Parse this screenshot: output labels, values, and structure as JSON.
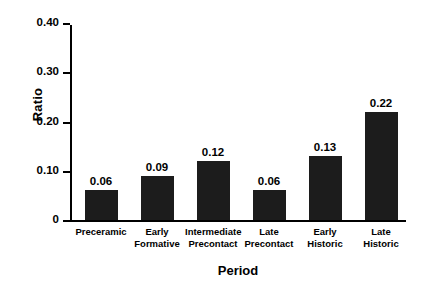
{
  "chart_data": {
    "type": "bar",
    "title": "",
    "xlabel": "Period",
    "ylabel": "Ratio",
    "categories": [
      "Preceramic",
      "Early Formative",
      "Intermediate Precontact",
      "Late Precontact",
      "Early Historic",
      "Late Historic"
    ],
    "category_lines": [
      [
        "Preceramic"
      ],
      [
        "Early",
        "Formative"
      ],
      [
        "Intermediate",
        "Precontact"
      ],
      [
        "Late",
        "Precontact"
      ],
      [
        "Early",
        "Historic"
      ],
      [
        "Late",
        "Historic"
      ]
    ],
    "values": [
      0.06,
      0.09,
      0.12,
      0.06,
      0.13,
      0.22
    ],
    "value_labels": [
      "0.06",
      "0.09",
      "0.12",
      "0.06",
      "0.13",
      "0.22"
    ],
    "ylim": [
      0,
      0.4
    ],
    "yticks": [
      0,
      0.1,
      0.2,
      0.3,
      0.4
    ],
    "ytick_labels": [
      "0",
      "0.10",
      "0.20",
      "0.30",
      "0.40"
    ],
    "grid": false,
    "legend": null,
    "bar_color": "#1c1c1c",
    "background_color": "#ffffff",
    "axis_color": "#000000"
  }
}
